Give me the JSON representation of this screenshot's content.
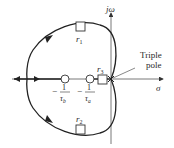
{
  "diagram": {
    "type": "root-locus",
    "axes": {
      "vertical_label": "jω",
      "horizontal_label": "σ"
    },
    "annotation": {
      "line1": "Triple",
      "line2": "pole"
    },
    "zeros": [
      {
        "id": "zero-b",
        "label_num": "1",
        "label_den": "τ",
        "label_sub": "b",
        "sign": "−"
      },
      {
        "id": "zero-a",
        "label_num": "1",
        "label_den": "τ",
        "label_sub": "a",
        "sign": "−"
      }
    ],
    "roots": [
      {
        "id": "r1",
        "label": "r",
        "sub": "1"
      },
      {
        "id": "r2",
        "label": "r",
        "sub": "2"
      },
      {
        "id": "r3",
        "label": "r",
        "sub": "3"
      }
    ],
    "colors": {
      "line": "#222222",
      "axis": "#333333",
      "background": "#ffffff"
    }
  }
}
